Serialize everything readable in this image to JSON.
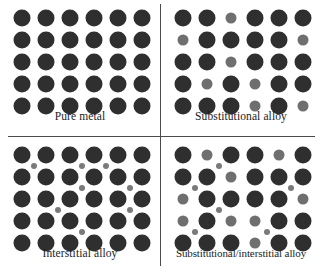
{
  "figure": {
    "colors": {
      "host_atom": "#2f2f2f",
      "substitutional_atom": "#6f6f6f",
      "interstitial_atom": "#7a7a7a",
      "divider": "#4a4a4a",
      "background": "#ffffff",
      "caption_text": "#1c1c1c"
    },
    "lattice": {
      "columns": 6,
      "rows": 5,
      "col_spacing": 24,
      "row_spacing": 22,
      "origin_x": 22,
      "origin_y": 18
    }
  },
  "panels": [
    {
      "id": "pure-metal",
      "caption": "Pure metal",
      "position": "top-left",
      "host_atoms": [
        [
          1,
          1
        ],
        [
          1,
          2
        ],
        [
          1,
          3
        ],
        [
          1,
          4
        ],
        [
          1,
          5
        ],
        [
          1,
          6
        ],
        [
          2,
          1
        ],
        [
          2,
          2
        ],
        [
          2,
          3
        ],
        [
          2,
          4
        ],
        [
          2,
          5
        ],
        [
          2,
          6
        ],
        [
          3,
          1
        ],
        [
          3,
          2
        ],
        [
          3,
          3
        ],
        [
          3,
          4
        ],
        [
          3,
          5
        ],
        [
          3,
          6
        ],
        [
          4,
          1
        ],
        [
          4,
          2
        ],
        [
          4,
          3
        ],
        [
          4,
          4
        ],
        [
          4,
          5
        ],
        [
          4,
          6
        ],
        [
          5,
          1
        ],
        [
          5,
          2
        ],
        [
          5,
          3
        ],
        [
          5,
          4
        ],
        [
          5,
          5
        ],
        [
          5,
          6
        ]
      ],
      "substitutional_atoms": [],
      "interstitial_atoms": []
    },
    {
      "id": "substitutional-alloy",
      "caption": "Substitutional alloy",
      "position": "top-right",
      "host_atoms": [
        [
          1,
          1
        ],
        [
          1,
          2
        ],
        [
          1,
          4
        ],
        [
          1,
          5
        ],
        [
          1,
          6
        ],
        [
          2,
          2
        ],
        [
          2,
          3
        ],
        [
          2,
          4
        ],
        [
          2,
          5
        ],
        [
          3,
          1
        ],
        [
          3,
          2
        ],
        [
          3,
          4
        ],
        [
          3,
          5
        ],
        [
          3,
          6
        ],
        [
          4,
          1
        ],
        [
          4,
          3
        ],
        [
          4,
          5
        ],
        [
          4,
          6
        ],
        [
          5,
          1
        ],
        [
          5,
          2
        ],
        [
          5,
          3
        ],
        [
          5,
          5
        ]
      ],
      "substitutional_atoms": [
        [
          1,
          3
        ],
        [
          2,
          1
        ],
        [
          2,
          6
        ],
        [
          3,
          3
        ],
        [
          4,
          2
        ],
        [
          4,
          4
        ],
        [
          5,
          4
        ],
        [
          5,
          6
        ]
      ],
      "interstitial_atoms": []
    },
    {
      "id": "interstitial-alloy",
      "caption": "Interstitial alloy",
      "position": "bottom-left",
      "host_atoms": [
        [
          1,
          1
        ],
        [
          1,
          2
        ],
        [
          1,
          3
        ],
        [
          1,
          4
        ],
        [
          1,
          5
        ],
        [
          1,
          6
        ],
        [
          2,
          1
        ],
        [
          2,
          2
        ],
        [
          2,
          3
        ],
        [
          2,
          4
        ],
        [
          2,
          5
        ],
        [
          2,
          6
        ],
        [
          3,
          1
        ],
        [
          3,
          2
        ],
        [
          3,
          3
        ],
        [
          3,
          4
        ],
        [
          3,
          5
        ],
        [
          3,
          6
        ],
        [
          4,
          1
        ],
        [
          4,
          2
        ],
        [
          4,
          3
        ],
        [
          4,
          4
        ],
        [
          4,
          5
        ],
        [
          4,
          6
        ],
        [
          5,
          1
        ],
        [
          5,
          2
        ],
        [
          5,
          3
        ],
        [
          5,
          4
        ],
        [
          5,
          5
        ],
        [
          5,
          6
        ]
      ],
      "substitutional_atoms": [],
      "interstitial_atoms": [
        [
          1.5,
          1.5
        ],
        [
          1.5,
          3.5
        ],
        [
          1.5,
          4.5
        ],
        [
          2.5,
          3.5
        ],
        [
          2.5,
          5.5
        ],
        [
          3.5,
          2.5
        ],
        [
          3.5,
          5.5
        ],
        [
          4.5,
          3.5
        ]
      ]
    },
    {
      "id": "substitutional-interstitial-alloy",
      "caption": "Substitutional/interstitial alloy",
      "position": "bottom-right",
      "host_atoms": [
        [
          1,
          1
        ],
        [
          1,
          3
        ],
        [
          1,
          4
        ],
        [
          1,
          6
        ],
        [
          2,
          1
        ],
        [
          2,
          2
        ],
        [
          2,
          4
        ],
        [
          2,
          5
        ],
        [
          2,
          6
        ],
        [
          3,
          2
        ],
        [
          3,
          3
        ],
        [
          3,
          4
        ],
        [
          3,
          5
        ],
        [
          4,
          2
        ],
        [
          4,
          5
        ],
        [
          4,
          6
        ],
        [
          5,
          1
        ],
        [
          5,
          2
        ],
        [
          5,
          3
        ],
        [
          5,
          5
        ],
        [
          5,
          6
        ]
      ],
      "substitutional_atoms": [
        [
          1,
          2
        ],
        [
          1,
          5
        ],
        [
          2,
          3
        ],
        [
          3,
          1
        ],
        [
          3,
          6
        ],
        [
          4,
          1
        ],
        [
          4,
          3
        ],
        [
          4,
          4
        ],
        [
          5,
          4
        ]
      ],
      "interstitial_atoms": [
        [
          1.5,
          2.5
        ],
        [
          2.5,
          1.5
        ],
        [
          2.5,
          5.5
        ],
        [
          3.5,
          2.5
        ],
        [
          4.5,
          1.5
        ],
        [
          4.5,
          4.5
        ]
      ]
    }
  ]
}
